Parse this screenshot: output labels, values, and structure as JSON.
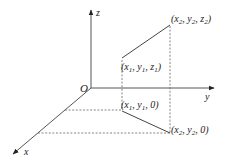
{
  "diagram": {
    "type": "3d-coordinate-system",
    "origin": {
      "label": "O",
      "x": 91,
      "y": 88
    },
    "axes": {
      "z": {
        "label": "z",
        "end": [
          91,
          9
        ]
      },
      "y": {
        "label": "y",
        "end": [
          215,
          88
        ]
      },
      "x": {
        "label": "x",
        "end": [
          12,
          155
        ]
      }
    },
    "points": {
      "p1": {
        "label": "(x1, y1, z1)",
        "base": "x",
        "sub": "1",
        "coords": [
          122,
          58
        ]
      },
      "p2": {
        "label": "(x2, y2, z2)",
        "coords": [
          170,
          25
        ]
      },
      "p1_proj": {
        "label": "(x1, y1, 0)",
        "coords": [
          122,
          110
        ]
      },
      "p2_proj": {
        "label": "(x2, y2, 0)",
        "coords": [
          170,
          133
        ]
      }
    },
    "labels": {
      "O": "O",
      "x": "x",
      "y": "y",
      "z": "z",
      "p1": {
        "x": "x",
        "xs": "1",
        "y": "y",
        "ys": "1",
        "z": "z",
        "zs": "1"
      },
      "p2": {
        "x": "x",
        "xs": "2",
        "y": "y",
        "ys": "2",
        "z": "z",
        "zs": "2"
      },
      "p1_proj": {
        "x": "x",
        "xs": "1",
        "y": "y",
        "ys": "1",
        "z": "0"
      },
      "p2_proj": {
        "x": "x",
        "xs": "2",
        "y": "y",
        "ys": "2",
        "z": "0"
      }
    },
    "colors": {
      "axis": "#555555",
      "text": "#222222",
      "background": "#ffffff"
    }
  }
}
